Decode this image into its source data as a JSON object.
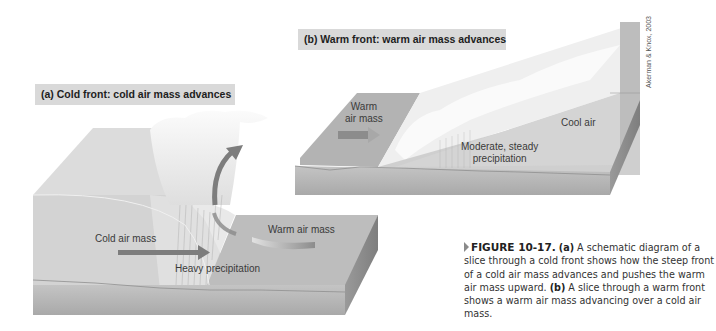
{
  "figure": {
    "number": "FIGURE 10-17.",
    "credit": "Akerman & Knox, 2003"
  },
  "panel_a": {
    "title": "(a) Cold front: cold air mass advances",
    "labels": {
      "cold_air_mass": "Cold air mass",
      "warm_air_mass": "Warm air mass",
      "heavy_precipitation": "Heavy precipitation"
    }
  },
  "panel_b": {
    "title": "(b) Warm front: warm air mass advances",
    "labels": {
      "warm_air_mass_line1": "Warm",
      "warm_air_mass_line2": "air mass",
      "cool_air": "Cool air",
      "precip_line1": "Moderate, steady",
      "precip_line2": "precipitation"
    }
  },
  "caption": {
    "part_a_label": "(a)",
    "part_a_text": " A schematic diagram of a slice through a cold front shows how the steep front of a cold air mass advances and pushes the warm air mass upward. ",
    "part_b_label": "(b)",
    "part_b_text": " A slice through a warm front shows a warm air mass advancing over a cold air mass."
  },
  "colors": {
    "title_bg": "#d9d9d9",
    "ground": "#b5b5b5",
    "air": "#cfcfcf",
    "arrow": "#7d7d7d"
  }
}
